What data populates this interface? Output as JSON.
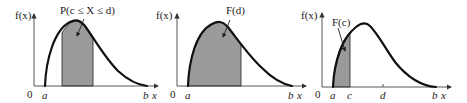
{
  "colors": {
    "background": "#ffffff",
    "shade": "#9a9a9a",
    "curve": "#111111",
    "axis": "#444444"
  },
  "panels": [
    {
      "id": "probability-between",
      "y_axis_label": "f(x)",
      "x_axis_label": "x",
      "origin_label": "0",
      "x_ticks": [
        "a",
        "b"
      ],
      "annotation": "P(c ≤ X ≤ d)",
      "shaded_region": "c to d"
    },
    {
      "id": "cdf-at-d",
      "y_axis_label": "f(x)",
      "x_axis_label": "x",
      "origin_label": "0",
      "x_ticks": [
        "a",
        "b"
      ],
      "annotation": "F(d)",
      "shaded_region": "a to d"
    },
    {
      "id": "cdf-at-c",
      "y_axis_label": "f(x)",
      "x_axis_label": "x",
      "origin_label": "0",
      "x_ticks": [
        "a",
        "c",
        "d",
        "b"
      ],
      "annotation": "F(c)",
      "shaded_region": "a to c"
    }
  ]
}
